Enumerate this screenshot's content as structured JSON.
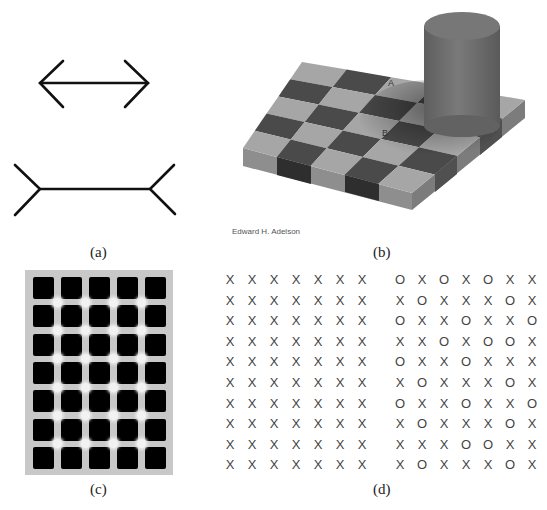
{
  "figure": {
    "panels": [
      {
        "id": "a",
        "caption": "(a)",
        "description": "Müller-Lyer illusion",
        "figures": [
          "arrow-heads-inward-shaft",
          "fins-outward-shaft"
        ]
      },
      {
        "id": "b",
        "caption": "(b)",
        "description": "Checker shadow illusion",
        "credit": "Edward H. Adelson",
        "square_labels": [
          "A",
          "B"
        ]
      },
      {
        "id": "c",
        "caption": "(c)",
        "description": "Hermann grid illusion",
        "grid": {
          "rows": 7,
          "cols": 5
        }
      },
      {
        "id": "d",
        "caption": "(d)",
        "description": "X and O pattern grids",
        "left_grid": [
          [
            "X",
            "X",
            "X",
            "X",
            "X",
            "X",
            "X"
          ],
          [
            "X",
            "X",
            "X",
            "X",
            "X",
            "X",
            "X"
          ],
          [
            "X",
            "X",
            "X",
            "X",
            "X",
            "X",
            "X"
          ],
          [
            "X",
            "X",
            "X",
            "X",
            "X",
            "X",
            "X"
          ],
          [
            "X",
            "X",
            "X",
            "X",
            "X",
            "X",
            "X"
          ],
          [
            "X",
            "X",
            "X",
            "X",
            "X",
            "X",
            "X"
          ],
          [
            "X",
            "X",
            "X",
            "X",
            "X",
            "X",
            "X"
          ],
          [
            "X",
            "X",
            "X",
            "X",
            "X",
            "X",
            "X"
          ],
          [
            "X",
            "X",
            "X",
            "X",
            "X",
            "X",
            "X"
          ],
          [
            "X",
            "X",
            "X",
            "X",
            "X",
            "X",
            "X"
          ]
        ],
        "right_grid": [
          [
            "O",
            "X",
            "O",
            "X",
            "O",
            "X",
            "X"
          ],
          [
            "X",
            "O",
            "X",
            "X",
            "X",
            "O",
            "X"
          ],
          [
            "O",
            "X",
            "X",
            "O",
            "X",
            "X",
            "O"
          ],
          [
            "X",
            "X",
            "O",
            "X",
            "O",
            "O",
            "X"
          ],
          [
            "O",
            "X",
            "X",
            "O",
            "X",
            "X",
            "X"
          ],
          [
            "X",
            "O",
            "X",
            "X",
            "X",
            "O",
            "X"
          ],
          [
            "O",
            "X",
            "X",
            "O",
            "X",
            "X",
            "O"
          ],
          [
            "X",
            "O",
            "X",
            "X",
            "X",
            "O",
            "X"
          ],
          [
            "X",
            "X",
            "X",
            "O",
            "O",
            "X",
            "X"
          ],
          [
            "X",
            "O",
            "X",
            "X",
            "X",
            "O",
            "X"
          ]
        ]
      }
    ]
  },
  "colors": {
    "line": "#111111",
    "light_square": "#a6a6a6",
    "dark_square": "#4a4a4a",
    "cylinder": "#6f6f6f",
    "hermann_bg": "#c8c8c8",
    "hermann_cell": "#000000"
  }
}
